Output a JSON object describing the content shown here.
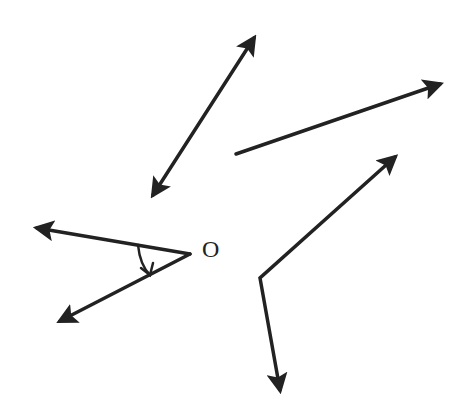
{
  "diagram": {
    "type": "geometry-figure",
    "stroke_color": "#222222",
    "vertex_label": "O",
    "elements": [
      {
        "kind": "line",
        "name": "double-arrow-line",
        "from": [
          153,
          195
        ],
        "to": [
          254,
          38
        ],
        "arrows": [
          "start",
          "end"
        ]
      },
      {
        "kind": "ray",
        "name": "ray-right",
        "from": [
          236,
          154
        ],
        "to": [
          442,
          84
        ],
        "arrows": [
          "end"
        ]
      },
      {
        "kind": "angle",
        "name": "angle-at-O",
        "vertex": [
          190,
          254
        ],
        "rays": [
          [
            35,
            227
          ],
          [
            58,
            322
          ]
        ],
        "arc": true
      },
      {
        "kind": "angle",
        "name": "bent-angle",
        "vertex": [
          260,
          278
        ],
        "rays": [
          [
            397,
            155
          ],
          [
            282,
            392
          ]
        ]
      }
    ]
  }
}
